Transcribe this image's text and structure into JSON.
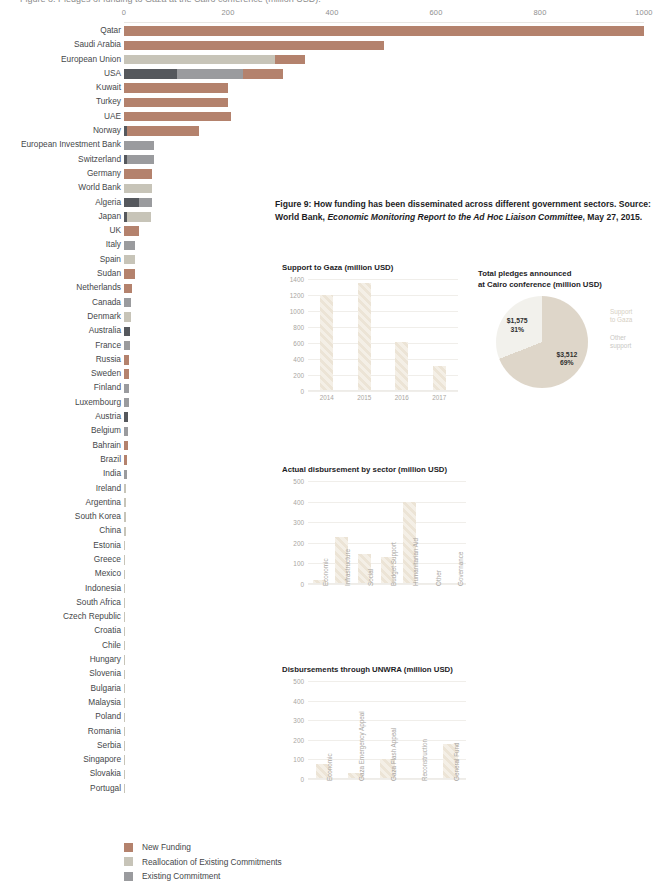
{
  "clipped_top_text": "Figure 8: Pledges of funding to Gaza at the Cairo conference (million USD).",
  "colors": {
    "new_funding": "#b4826d",
    "reallocation": "#c7c4b8",
    "existing_commitment": "#9a9b9e",
    "dark_commitment": "#55585d",
    "pie_beige": "#ded6c9",
    "pie_offwhite": "#f2f1ec",
    "pie_lightgray": "#e4e4e1",
    "pie_midgray": "#b4b4b2",
    "pie_darkgray": "#a8a8a5",
    "bar_hatch": "#f4efe6"
  },
  "legend": {
    "items": [
      {
        "label": "New Funding",
        "color": "#b4826d"
      },
      {
        "label": "Reallocation of Existing Commitments",
        "color": "#c7c4b8"
      },
      {
        "label": "Existing Commitment",
        "color": "#9a9b9e"
      }
    ]
  },
  "caption": {
    "line1_a": "Figure 9: How funding has been disseminated across different government sectors.",
    "line2_a": "Source: World Bank, ",
    "line2_em": "Economic Monitoring Report to the Ad Hoc Liaison Committee",
    "line2_b": ",",
    "line3": "May 27, 2015."
  },
  "chart_data": [
    {
      "type": "bar",
      "id": "pledges-by-donor",
      "orientation": "horizontal",
      "stacked": true,
      "title": "",
      "xlabel": "",
      "ylabel": "",
      "xlim": [
        0,
        1000
      ],
      "xticks": [
        0,
        200,
        400,
        600,
        800,
        1000
      ],
      "grid": false,
      "series_names": [
        "New Funding",
        "Reallocation of Existing Commitments",
        "Existing Commitment",
        "Other"
      ],
      "categories": [
        "Qatar",
        "Saudi Arabia",
        "European Union",
        "USA",
        "Kuwait",
        "Turkey",
        "UAE",
        "Norway",
        "European Investment Bank",
        "Switzerland",
        "Germany",
        "World Bank",
        "Algeria",
        "Japan",
        "UK",
        "Italy",
        "Spain",
        "Sudan",
        "Netherlands",
        "Canada",
        "Denmark",
        "Australia",
        "France",
        "Russia",
        "Sweden",
        "Finland",
        "Luxembourg",
        "Austria",
        "Belgium",
        "Bahrain",
        "Brazil",
        "India",
        "Ireland",
        "Argentina",
        "South Korea",
        "China",
        "Estonia",
        "Greece",
        "Mexico",
        "Indonesia",
        "South Africa",
        "Czech Republic",
        "Croatia",
        "Chile",
        "Hungary",
        "Slovenia",
        "Bulgaria",
        "Malaysia",
        "Poland",
        "Romania",
        "Serbia",
        "Singapore",
        "Slovakia",
        "Portugal"
      ],
      "rows": [
        {
          "name": "Qatar",
          "segments": [
            {
              "v": 1000,
              "c": "#b4826d"
            }
          ]
        },
        {
          "name": "Saudi Arabia",
          "segments": [
            {
              "v": 500,
              "c": "#b4826d"
            }
          ]
        },
        {
          "name": "European Union",
          "segments": [
            {
              "v": 290,
              "c": "#c7c4b8"
            },
            {
              "v": 58,
              "c": "#b4826d"
            }
          ]
        },
        {
          "name": "USA",
          "segments": [
            {
              "v": 102,
              "c": "#55585d"
            },
            {
              "v": 127,
              "c": "#9a9b9e"
            },
            {
              "v": 77,
              "c": "#b4826d"
            }
          ]
        },
        {
          "name": "Kuwait",
          "segments": [
            {
              "v": 200,
              "c": "#b4826d"
            }
          ]
        },
        {
          "name": "Turkey",
          "segments": [
            {
              "v": 200,
              "c": "#b4826d"
            }
          ]
        },
        {
          "name": "UAE",
          "segments": [
            {
              "v": 206,
              "c": "#b4826d"
            }
          ]
        },
        {
          "name": "Norway",
          "segments": [
            {
              "v": 6,
              "c": "#55585d"
            },
            {
              "v": 139,
              "c": "#b4826d"
            }
          ]
        },
        {
          "name": "European Investment Bank",
          "segments": [
            {
              "v": 57,
              "c": "#9a9b9e"
            }
          ]
        },
        {
          "name": "Switzerland",
          "segments": [
            {
              "v": 6,
              "c": "#55585d"
            },
            {
              "v": 51,
              "c": "#9a9b9e"
            }
          ]
        },
        {
          "name": "Germany",
          "segments": [
            {
              "v": 54,
              "c": "#b4826d"
            }
          ]
        },
        {
          "name": "World Bank",
          "segments": [
            {
              "v": 53,
              "c": "#c7c4b8"
            }
          ]
        },
        {
          "name": "Algeria",
          "segments": [
            {
              "v": 28,
              "c": "#55585d"
            },
            {
              "v": 25,
              "c": "#9a9b9e"
            }
          ]
        },
        {
          "name": "Japan",
          "segments": [
            {
              "v": 5,
              "c": "#55585d"
            },
            {
              "v": 47,
              "c": "#c7c4b8"
            }
          ]
        },
        {
          "name": "UK",
          "segments": [
            {
              "v": 29,
              "c": "#b4826d"
            }
          ]
        },
        {
          "name": "Italy",
          "segments": [
            {
              "v": 22,
              "c": "#9a9b9e"
            }
          ]
        },
        {
          "name": "Spain",
          "segments": [
            {
              "v": 22,
              "c": "#c7c4b8"
            }
          ]
        },
        {
          "name": "Sudan",
          "segments": [
            {
              "v": 21,
              "c": "#b4826d"
            }
          ]
        },
        {
          "name": "Netherlands",
          "segments": [
            {
              "v": 15,
              "c": "#b4826d"
            }
          ]
        },
        {
          "name": "Canada",
          "segments": [
            {
              "v": 14,
              "c": "#9a9b9e"
            }
          ]
        },
        {
          "name": "Denmark",
          "segments": [
            {
              "v": 13,
              "c": "#c7c4b8"
            }
          ]
        },
        {
          "name": "Australia",
          "segments": [
            {
              "v": 12,
              "c": "#55585d"
            }
          ]
        },
        {
          "name": "France",
          "segments": [
            {
              "v": 11,
              "c": "#9a9b9e"
            }
          ]
        },
        {
          "name": "Russia",
          "segments": [
            {
              "v": 10,
              "c": "#b4826d"
            }
          ]
        },
        {
          "name": "Sweden",
          "segments": [
            {
              "v": 10,
              "c": "#b4826d"
            }
          ]
        },
        {
          "name": "Finland",
          "segments": [
            {
              "v": 9,
              "c": "#9a9b9e"
            }
          ]
        },
        {
          "name": "Luxembourg",
          "segments": [
            {
              "v": 9,
              "c": "#9a9b9e"
            }
          ]
        },
        {
          "name": "Austria",
          "segments": [
            {
              "v": 8,
              "c": "#55585d"
            }
          ]
        },
        {
          "name": "Belgium",
          "segments": [
            {
              "v": 8,
              "c": "#9a9b9e"
            }
          ]
        },
        {
          "name": "Bahrain",
          "segments": [
            {
              "v": 8,
              "c": "#b4826d"
            }
          ]
        },
        {
          "name": "Brazil",
          "segments": [
            {
              "v": 6,
              "c": "#b4826d"
            }
          ]
        },
        {
          "name": "India",
          "segments": [
            {
              "v": 5,
              "c": "#9a9b9e"
            }
          ]
        },
        {
          "name": "Ireland",
          "segments": [
            {
              "v": 4,
              "c": "#c7c4b8"
            }
          ]
        },
        {
          "name": "Argentina",
          "segments": [
            {
              "v": 3,
              "c": "#c7c4b8"
            }
          ]
        },
        {
          "name": "South Korea",
          "segments": [
            {
              "v": 3,
              "c": "#c7c4b8"
            }
          ]
        },
        {
          "name": "China",
          "segments": [
            {
              "v": 3,
              "c": "#c7c4b8"
            }
          ]
        },
        {
          "name": "Estonia",
          "segments": [
            {
              "v": 2,
              "c": "#c7c4b8"
            }
          ]
        },
        {
          "name": "Greece",
          "segments": [
            {
              "v": 2,
              "c": "#c7c4b8"
            }
          ]
        },
        {
          "name": "Mexico",
          "segments": [
            {
              "v": 2,
              "c": "#c7c4b8"
            }
          ]
        },
        {
          "name": "Indonesia",
          "segments": [
            {
              "v": 2,
              "c": "#c7c4b8"
            }
          ]
        },
        {
          "name": "South Africa",
          "segments": [
            {
              "v": 2,
              "c": "#c7c4b8"
            }
          ]
        },
        {
          "name": "Czech Republic",
          "segments": [
            {
              "v": 2,
              "c": "#c7c4b8"
            }
          ]
        },
        {
          "name": "Croatia",
          "segments": [
            {
              "v": 2,
              "c": "#c7c4b8"
            }
          ]
        },
        {
          "name": "Chile",
          "segments": [
            {
              "v": 2,
              "c": "#c7c4b8"
            }
          ]
        },
        {
          "name": "Hungary",
          "segments": [
            {
              "v": 1,
              "c": "#c7c4b8"
            }
          ]
        },
        {
          "name": "Slovenia",
          "segments": [
            {
              "v": 1,
              "c": "#c7c4b8"
            }
          ]
        },
        {
          "name": "Bulgaria",
          "segments": [
            {
              "v": 1,
              "c": "#c7c4b8"
            }
          ]
        },
        {
          "name": "Malaysia",
          "segments": [
            {
              "v": 1,
              "c": "#c7c4b8"
            }
          ]
        },
        {
          "name": "Poland",
          "segments": [
            {
              "v": 1,
              "c": "#c7c4b8"
            }
          ]
        },
        {
          "name": "Romania",
          "segments": [
            {
              "v": 1,
              "c": "#c7c4b8"
            }
          ]
        },
        {
          "name": "Serbia",
          "segments": [
            {
              "v": 1,
              "c": "#c7c4b8"
            }
          ]
        },
        {
          "name": "Singapore",
          "segments": [
            {
              "v": 1,
              "c": "#c7c4b8"
            }
          ]
        },
        {
          "name": "Slovakia",
          "segments": [
            {
              "v": 1,
              "c": "#c7c4b8"
            }
          ]
        },
        {
          "name": "Portugal",
          "segments": [
            {
              "v": 0.5,
              "c": "#c7c4b8"
            }
          ]
        }
      ]
    },
    {
      "type": "bar",
      "id": "support-to-gaza",
      "title": "Support to Gaza (million USD)",
      "categories": [
        "2014",
        "2015",
        "2016",
        "2017"
      ],
      "values": [
        1200,
        1350,
        615,
        310
      ],
      "xlabel": "",
      "ylabel": "",
      "ylim": [
        0,
        1400
      ],
      "yticks": [
        0,
        200,
        400,
        600,
        800,
        1000,
        1200,
        1400
      ],
      "grid": true
    },
    {
      "type": "pie",
      "id": "total-pledges-cairo",
      "title": "Total pledges announced\nat Cairo conference (million USD)",
      "slices": [
        {
          "label": "Support\nto Gaza",
          "value": 3512,
          "percent": 69,
          "display": "$3,512\n69%",
          "color": "#ded6c9"
        },
        {
          "label": "Other\nsupport",
          "value": 1575,
          "percent": 31,
          "display": "$1,575\n31%",
          "color": "#f2f1ec"
        }
      ],
      "legend_position": "right"
    },
    {
      "type": "bar",
      "id": "actual-disbursement-by-sector",
      "title": "Actual disbursement by sector (million USD)",
      "categories": [
        "Economic",
        "Infrastructure",
        "Social",
        "Budget Support",
        "Humanitarian Aid",
        "Other",
        "Governance"
      ],
      "values": [
        20,
        230,
        145,
        130,
        398,
        3,
        3
      ],
      "xlabel": "",
      "ylabel": "",
      "ylim": [
        0,
        500
      ],
      "yticks": [
        0,
        100,
        200,
        300,
        400,
        500
      ],
      "grid": true
    },
    {
      "type": "pie",
      "id": "support-to-gaza-classification",
      "title": "Support to Gaza classification\n(million USD)",
      "slices": [
        {
          "label": "Assistance\ndisbursed\nduring conflict",
          "value": 194,
          "percent": 5,
          "display": "$194\n5%",
          "color": "#b4b4b2"
        },
        {
          "label": "Existing\ncommitment",
          "value": 315,
          "percent": 9,
          "display": "$315\n9%",
          "color": "#e4e4e1"
        },
        {
          "label": "Reallocation\nof existing\ncommitments",
          "value": 477,
          "percent": 14,
          "display": "$477\n14%",
          "color": "#f2f1ec"
        },
        {
          "label": "New funding",
          "value": 2526,
          "percent": 72,
          "display": "$2,526\n72%",
          "color": "#ded6c9"
        }
      ],
      "legend_position": "right"
    },
    {
      "type": "bar",
      "id": "disbursements-through-unwra",
      "title": "Disbursements through UNWRA (million USD)",
      "categories": [
        "Economic",
        "Gaza Emergency Appeal",
        "Gaza Flash Appeal",
        "Reconstruction",
        "General Fund"
      ],
      "values": [
        78,
        33,
        100,
        5,
        180
      ],
      "xlabel": "",
      "ylabel": "",
      "ylim": [
        0,
        500
      ],
      "yticks": [
        0,
        100,
        200,
        300,
        400,
        500
      ],
      "grid": true
    },
    {
      "type": "pie",
      "id": "classification-of-disbursement",
      "title": "Classification of disbursement\nof support to Gaza",
      "slices": [
        {
          "label": "New funding",
          "percent": 35,
          "display": "35%",
          "color": "#b4b4b2"
        },
        {
          "label": "Prior to Cairo\nconference",
          "percent": 20,
          "display": "20%",
          "color": "#e4e4e1"
        },
        {
          "label": "Existing and\nreallocations",
          "percent": 45,
          "display": "45%",
          "color": "#eceae5"
        }
      ],
      "legend_position": "right"
    }
  ]
}
